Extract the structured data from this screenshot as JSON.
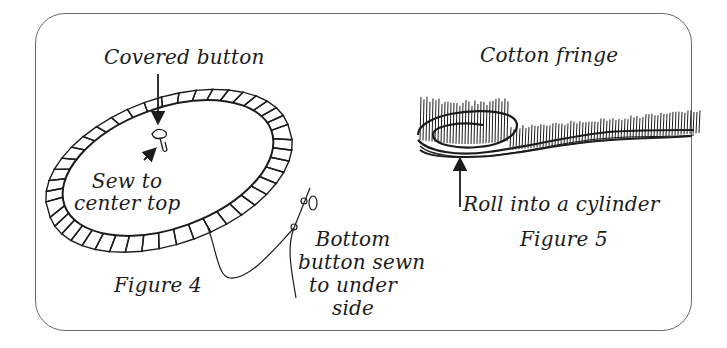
{
  "figure4": {
    "title": "Figure 4",
    "labels": {
      "covered_button": "Covered button",
      "sew_line1": "Sew to",
      "sew_line2": "center top",
      "bottom_line1": "Bottom",
      "bottom_line2": "button sewn",
      "bottom_line3": "to under",
      "bottom_line4": "side"
    }
  },
  "figure5": {
    "title": "Figure 5",
    "labels": {
      "cotton_fringe": "Cotton fringe",
      "roll": "Roll into a cylinder"
    }
  },
  "colors": {
    "ink": "#1c1c1c",
    "frame": "#6a6a6a",
    "background": "#ffffff"
  }
}
